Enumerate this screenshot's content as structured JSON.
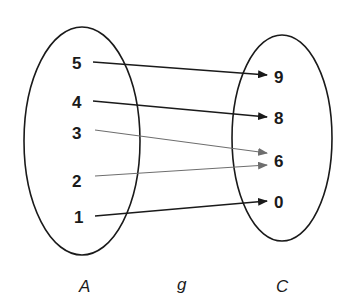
{
  "diagram": {
    "function_name": "g",
    "domain_set": {
      "label": "A",
      "elements": [
        "5",
        "4",
        "3",
        "2",
        "1"
      ]
    },
    "codomain_set": {
      "label": "C",
      "elements": [
        "9",
        "8",
        "6",
        "0"
      ]
    },
    "mappings": [
      {
        "from": "5",
        "to": "9"
      },
      {
        "from": "4",
        "to": "8"
      },
      {
        "from": "3",
        "to": "6"
      },
      {
        "from": "2",
        "to": "6"
      },
      {
        "from": "1",
        "to": "0"
      }
    ]
  },
  "labels": {
    "set_a": "A",
    "func": "g",
    "set_c": "C",
    "a5": "5",
    "a4": "4",
    "a3": "3",
    "a2": "2",
    "a1": "1",
    "c9": "9",
    "c8": "8",
    "c6": "6",
    "c0": "0"
  },
  "colors": {
    "dark_arrow": "#1a1a1a",
    "gray_arrow": "#6e6e6e"
  }
}
